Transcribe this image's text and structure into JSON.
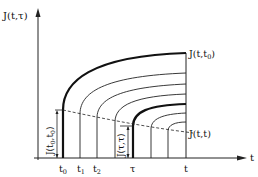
{
  "diagram": {
    "y_axis_label": "J(t,τ)",
    "x_axis_label": "t",
    "curve_top_label": "J(t,t",
    "curve_top_sub": "0",
    "curve_top_close": ")",
    "diag_label": "J(t,t)",
    "left_vertical_label": "J(t",
    "left_vertical_sub": "0",
    "left_vertical_mid": ",t",
    "left_vertical_sub2": "0",
    "left_vertical_close": ")",
    "tau_vertical_label": "J(τ,τ)",
    "ticks": [
      {
        "label": "t",
        "sub": "0"
      },
      {
        "label": "t",
        "sub": "1"
      },
      {
        "label": "t",
        "sub": "2"
      },
      {
        "label": "τ",
        "sub": ""
      },
      {
        "label": "t",
        "sub": ""
      }
    ]
  }
}
